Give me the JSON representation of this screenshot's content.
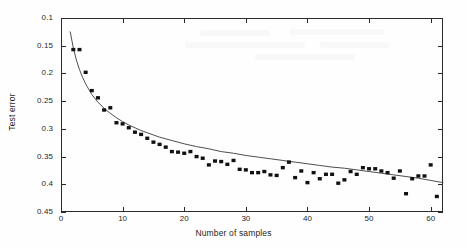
{
  "figure": {
    "kind": "scatter-with-fit",
    "background_color": "#ffffff",
    "axis_color": "#2b2b2b",
    "marker_color": "#111111",
    "curve_color": "#3a3a3a"
  },
  "axes": {
    "x_title": "Number of samples",
    "y_title": "Test error",
    "x_ticks": [
      "0",
      "10",
      "20",
      "30",
      "40",
      "50",
      "60"
    ],
    "y_ticks": [
      "0.45",
      "0.4",
      "0.35",
      "0.3",
      "0.25",
      "0.2",
      "0.15",
      "0.1"
    ]
  },
  "chart_data": {
    "type": "scatter",
    "title": "",
    "xlabel": "Number of samples",
    "ylabel": "Test error",
    "xlim": [
      0,
      62
    ],
    "ylim": [
      0.1,
      0.45
    ],
    "xticks": [
      0,
      10,
      20,
      30,
      40,
      50,
      60
    ],
    "yticks": [
      0.1,
      0.15,
      0.2,
      0.25,
      0.3,
      0.35,
      0.4,
      0.45
    ],
    "grid": false,
    "legend": null,
    "series": [
      {
        "name": "Test error (measured)",
        "kind": "scatter",
        "marker": "filled-square",
        "color": "#111111",
        "x": [
          2,
          3,
          4,
          5,
          6,
          7,
          8,
          9,
          10,
          11,
          12,
          13,
          14,
          15,
          16,
          17,
          18,
          19,
          20,
          21,
          22,
          23,
          24,
          25,
          26,
          27,
          28,
          29,
          30,
          31,
          32,
          33,
          34,
          35,
          36,
          37,
          38,
          39,
          40,
          41,
          42,
          43,
          44,
          45,
          46,
          47,
          48,
          49,
          50,
          51,
          52,
          53,
          54,
          55,
          56,
          57,
          58,
          59,
          60,
          61
        ],
        "y": [
          0.393,
          0.393,
          0.352,
          0.319,
          0.306,
          0.284,
          0.288,
          0.261,
          0.259,
          0.252,
          0.244,
          0.24,
          0.233,
          0.226,
          0.222,
          0.217,
          0.209,
          0.208,
          0.206,
          0.209,
          0.2,
          0.197,
          0.185,
          0.192,
          0.191,
          0.186,
          0.193,
          0.177,
          0.176,
          0.171,
          0.171,
          0.173,
          0.167,
          0.166,
          0.18,
          0.19,
          0.162,
          0.174,
          0.153,
          0.171,
          0.16,
          0.168,
          0.168,
          0.152,
          0.158,
          0.173,
          0.168,
          0.18,
          0.178,
          0.178,
          0.174,
          0.171,
          0.161,
          0.174,
          0.133,
          0.16,
          0.165,
          0.165,
          0.185,
          0.128
        ]
      },
      {
        "name": "Fitted curve",
        "kind": "line",
        "color": "#3a3a3a",
        "x": [
          1.5,
          2,
          2.5,
          3,
          3.5,
          4,
          5,
          6,
          7,
          8,
          9,
          10,
          11,
          12,
          13,
          14,
          15,
          16,
          17,
          18,
          19,
          20,
          22,
          24,
          26,
          28,
          30,
          32,
          34,
          36,
          38,
          40,
          42,
          44,
          46,
          48,
          50,
          52,
          54,
          56,
          58,
          60,
          62
        ],
        "y": [
          0.425,
          0.396,
          0.374,
          0.357,
          0.343,
          0.331,
          0.312,
          0.298,
          0.287,
          0.278,
          0.27,
          0.263,
          0.257,
          0.252,
          0.247,
          0.243,
          0.239,
          0.235,
          0.232,
          0.229,
          0.226,
          0.223,
          0.218,
          0.214,
          0.209,
          0.206,
          0.202,
          0.199,
          0.196,
          0.193,
          0.19,
          0.187,
          0.184,
          0.181,
          0.179,
          0.176,
          0.173,
          0.17,
          0.167,
          0.164,
          0.161,
          0.157,
          0.153
        ]
      }
    ]
  }
}
